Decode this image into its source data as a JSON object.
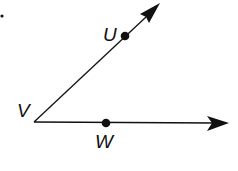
{
  "diagram": {
    "type": "angle-with-two-rays",
    "vertex": {
      "label": "V",
      "x": 34,
      "y": 122
    },
    "rays": [
      {
        "name": "ray-VU",
        "through": "U",
        "end": {
          "x": 160,
          "y": 4
        }
      },
      {
        "name": "ray-VW",
        "through": "W",
        "end": {
          "x": 228,
          "y": 123
        }
      }
    ],
    "points": [
      {
        "label": "U",
        "x": 125,
        "y": 36
      },
      {
        "label": "W",
        "x": 106,
        "y": 123
      }
    ],
    "labels": {
      "V": "V",
      "U": "U",
      "W": "W"
    },
    "stroke_color": "#111111"
  }
}
